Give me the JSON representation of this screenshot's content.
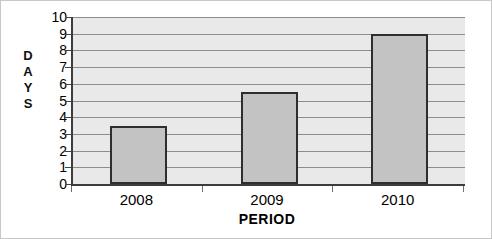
{
  "chart_data": {
    "type": "bar",
    "title": "",
    "subtitle": "",
    "categories": [
      "2008",
      "2009",
      "2010"
    ],
    "values": [
      3.5,
      5.5,
      9.0
    ],
    "series": [
      {
        "name": "Days",
        "values": [
          3.5,
          5.5,
          9.0
        ]
      }
    ],
    "xlabel": "PERIOD",
    "ylabel": "DAYS",
    "ylabel_letters": [
      "D",
      "A",
      "Y",
      "S"
    ],
    "ylim": [
      0,
      10
    ],
    "ytick_step": 1,
    "yticks": [
      "10",
      "9",
      "8",
      "7",
      "6",
      "5",
      "4",
      "3",
      "2",
      "1",
      "0"
    ],
    "ytick_values": [
      10,
      9,
      8,
      7,
      6,
      5,
      4,
      3,
      2,
      1,
      0
    ],
    "grid": true,
    "grid_orientation": "horizontal",
    "legend": false,
    "legend_position": "none",
    "annotations": [],
    "colors": {
      "bar_fill": "#c3c3c3",
      "bar_border": "#2e2e2e",
      "plot_background": "#e9e9e9",
      "gridline": "#8d8d8d",
      "axis_line": "#3c3c3c",
      "text": "#000000",
      "page_background": "#ffffff",
      "frame_border": "#c8c8c8"
    }
  }
}
